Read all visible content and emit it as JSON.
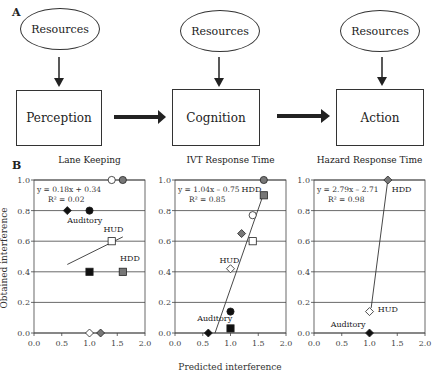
{
  "panel_a": {
    "label": "A",
    "resources": [
      "Resources",
      "Resources",
      "Resources"
    ],
    "stages": [
      "Perception",
      "Cognition",
      "Action"
    ]
  },
  "panel_b": {
    "label": "B",
    "ylabel": "Obtained interference",
    "xlabel": "Predicted interference"
  },
  "chart_data": [
    {
      "type": "scatter",
      "title": "Lane Keeping",
      "xlabel": "Predicted interference",
      "ylabel": "Obtained interference",
      "xlim": [
        0,
        2
      ],
      "ylim": [
        0,
        1
      ],
      "xticks": [
        "0.0",
        "0.5",
        "1.0",
        "1.5",
        "2.0"
      ],
      "yticks": [
        "0.0",
        "0.2",
        "0.4",
        "0.6",
        "0.8",
        "1.0"
      ],
      "grid": true,
      "equation": "y = 0.18x + 0.34",
      "r2": "R² = 0.02",
      "fit": {
        "slope": 0.18,
        "intercept": 0.34,
        "x_range": [
          0.6,
          1.6
        ]
      },
      "annotations": [
        {
          "text": "Auditory",
          "x": 0.6,
          "y": 0.72
        },
        {
          "text": "HUD",
          "x": 1.25,
          "y": 0.66
        },
        {
          "text": "HDD",
          "x": 1.55,
          "y": 0.47
        }
      ],
      "points": [
        {
          "x": 1.4,
          "y": 1.0,
          "marker": "circle",
          "fill": "#ffffff"
        },
        {
          "x": 1.6,
          "y": 1.0,
          "marker": "circle",
          "fill": "#777777"
        },
        {
          "x": 0.6,
          "y": 0.8,
          "marker": "diamond",
          "fill": "#111111"
        },
        {
          "x": 1.0,
          "y": 0.8,
          "marker": "circle",
          "fill": "#111111"
        },
        {
          "x": 1.4,
          "y": 0.6,
          "marker": "square",
          "fill": "#ffffff"
        },
        {
          "x": 1.0,
          "y": 0.4,
          "marker": "square",
          "fill": "#111111"
        },
        {
          "x": 1.6,
          "y": 0.4,
          "marker": "square",
          "fill": "#777777"
        },
        {
          "x": 1.0,
          "y": 0.0,
          "marker": "diamond",
          "fill": "#ffffff"
        },
        {
          "x": 1.2,
          "y": 0.0,
          "marker": "diamond",
          "fill": "#777777"
        }
      ]
    },
    {
      "type": "scatter",
      "title": "IVT Response Time",
      "xlabel": "Predicted interference",
      "ylabel": "Obtained interference",
      "xlim": [
        0,
        2
      ],
      "ylim": [
        0,
        1
      ],
      "xticks": [
        "0.0",
        "0.5",
        "1.0",
        "1.5",
        "2.0"
      ],
      "yticks": [
        "0.0",
        "0.2",
        "0.4",
        "0.6",
        "0.8",
        "1.0"
      ],
      "grid": true,
      "equation": "y = 1.04x – 0.75",
      "r2": "R² = 0.85",
      "fit": {
        "slope": 1.04,
        "intercept": -0.75,
        "x_range": [
          0.72,
          1.6
        ]
      },
      "annotations": [
        {
          "text": "HDD",
          "x": 1.2,
          "y": 0.92
        },
        {
          "text": "HUD",
          "x": 0.8,
          "y": 0.46
        },
        {
          "text": "Auditory",
          "x": 0.4,
          "y": 0.08
        }
      ],
      "points": [
        {
          "x": 1.6,
          "y": 1.0,
          "marker": "circle",
          "fill": "#777777"
        },
        {
          "x": 1.6,
          "y": 0.9,
          "marker": "square",
          "fill": "#777777"
        },
        {
          "x": 1.4,
          "y": 0.77,
          "marker": "circle",
          "fill": "#ffffff"
        },
        {
          "x": 1.2,
          "y": 0.65,
          "marker": "diamond",
          "fill": "#777777"
        },
        {
          "x": 1.4,
          "y": 0.6,
          "marker": "square",
          "fill": "#ffffff"
        },
        {
          "x": 1.0,
          "y": 0.42,
          "marker": "diamond",
          "fill": "#ffffff"
        },
        {
          "x": 1.0,
          "y": 0.14,
          "marker": "circle",
          "fill": "#111111"
        },
        {
          "x": 1.0,
          "y": 0.03,
          "marker": "square",
          "fill": "#111111"
        },
        {
          "x": 0.6,
          "y": 0.0,
          "marker": "diamond",
          "fill": "#111111"
        }
      ]
    },
    {
      "type": "scatter",
      "title": "Hazard Response Time",
      "xlabel": "Predicted interference",
      "ylabel": "Obtained interference",
      "xlim": [
        0,
        2
      ],
      "ylim": [
        0,
        1
      ],
      "xticks": [
        "0.0",
        "0.5",
        "1.0",
        "1.5",
        "2.0"
      ],
      "yticks": [
        "0.0",
        "0.2",
        "0.4",
        "0.6",
        "0.8",
        "1.0"
      ],
      "grid": true,
      "equation": "y = 2.79x – 2.71",
      "r2": "R² = 0.98",
      "fit": {
        "slope": 2.79,
        "intercept": -2.71,
        "x_range": [
          1.03,
          1.33
        ]
      },
      "annotations": [
        {
          "text": "HDD",
          "x": 1.4,
          "y": 0.92
        },
        {
          "text": "HUD",
          "x": 1.15,
          "y": 0.14
        },
        {
          "text": "Auditory",
          "x": 0.3,
          "y": 0.04
        }
      ],
      "points": [
        {
          "x": 1.33,
          "y": 1.0,
          "marker": "diamond",
          "fill": "#777777"
        },
        {
          "x": 1.0,
          "y": 0.14,
          "marker": "diamond",
          "fill": "#ffffff"
        },
        {
          "x": 1.0,
          "y": 0.0,
          "marker": "diamond",
          "fill": "#111111"
        }
      ]
    }
  ]
}
